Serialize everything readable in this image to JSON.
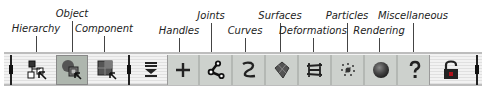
{
  "labels": {
    "hierarchy": "Hierarchy",
    "object": "Object",
    "component": "Component",
    "handles": "Handles",
    "joints": "Joints",
    "curves": "Curves",
    "surfaces": "Surfaces",
    "deformations": "Deformations",
    "particles": "Particles",
    "rendering": "Rendering",
    "miscellaneous": "Miscellaneous"
  },
  "selection_mode": {
    "buttons": [
      {
        "name": "hierarchy",
        "icon": "hierarchy-select-icon",
        "selected": false
      },
      {
        "name": "object",
        "icon": "object-select-icon",
        "selected": true
      },
      {
        "name": "component",
        "icon": "component-select-icon",
        "selected": false
      }
    ]
  },
  "mask_menu": {
    "icon": "mask-menu-icon"
  },
  "mask_buttons": [
    {
      "name": "handles",
      "icon": "plus-icon"
    },
    {
      "name": "joints",
      "icon": "joint-icon"
    },
    {
      "name": "curves",
      "icon": "curve-icon"
    },
    {
      "name": "surfaces",
      "icon": "surface-icon"
    },
    {
      "name": "deformations",
      "icon": "lattice-icon"
    },
    {
      "name": "particles",
      "icon": "particles-icon"
    },
    {
      "name": "rendering",
      "icon": "sphere-icon"
    },
    {
      "name": "miscellaneous",
      "icon": "question-icon"
    }
  ],
  "lock": {
    "icon": "lock-icon",
    "state": "unlocked"
  },
  "colors": {
    "selected_bg": "#aeb6ae",
    "shelf_bg": "#cdd1cd",
    "icon_dark": "#222222",
    "lock_red": "#b0101a"
  }
}
